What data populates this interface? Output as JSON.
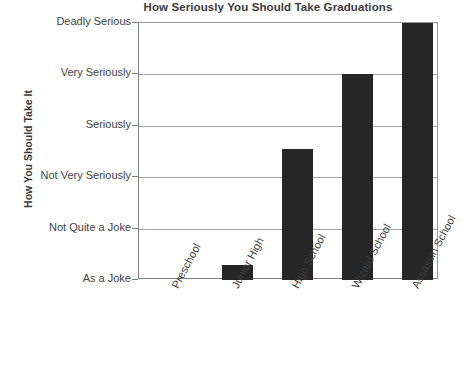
{
  "chart_data": {
    "type": "bar",
    "title": "How Seriously You Should Take Graduations",
    "xlabel": "",
    "ylabel": "How You Should Take It",
    "categories": [
      "Preschool",
      "Junior High",
      "High School",
      "Wizard School",
      "Assassin School"
    ],
    "values": [
      1,
      1.3,
      3.55,
      5,
      6
    ],
    "ytick_labels": [
      "Deadly Serious",
      "Very Seriously",
      "Seriously",
      "Not Very Seriously",
      "Not Quite a Joke",
      "As a Joke"
    ],
    "ylim": [
      0,
      6
    ],
    "grid": true,
    "legend": "none",
    "bar_color": "#262626",
    "grid_color": "#a6a6a6",
    "axis_color": "#808080",
    "series": [
      {
        "name": "How You Should Take It",
        "points": [
          {
            "category": "Preschool",
            "value": 1,
            "level": "As a Joke"
          },
          {
            "category": "Junior High",
            "value": 1.3,
            "level": "Between As a Joke and Not Quite a Joke"
          },
          {
            "category": "High School",
            "value": 3.55,
            "level": "Between Not Very Seriously and Seriously"
          },
          {
            "category": "Wizard School",
            "value": 5,
            "level": "Very Seriously"
          },
          {
            "category": "Assassin School",
            "value": 6,
            "level": "Deadly Serious"
          }
        ]
      }
    ]
  },
  "ytick_rows": [
    {
      "label": "Deadly Serious"
    },
    {
      "label": "Very Seriously"
    },
    {
      "label": "Seriously"
    },
    {
      "label": "Not Very Seriously"
    },
    {
      "label": "Not Quite a Joke"
    },
    {
      "label": "As a Joke"
    }
  ],
  "bars": [
    {
      "label": "Preschool"
    },
    {
      "label": "Junior High"
    },
    {
      "label": "High School"
    },
    {
      "label": "Wizard School"
    },
    {
      "label": "Assassin School"
    }
  ]
}
